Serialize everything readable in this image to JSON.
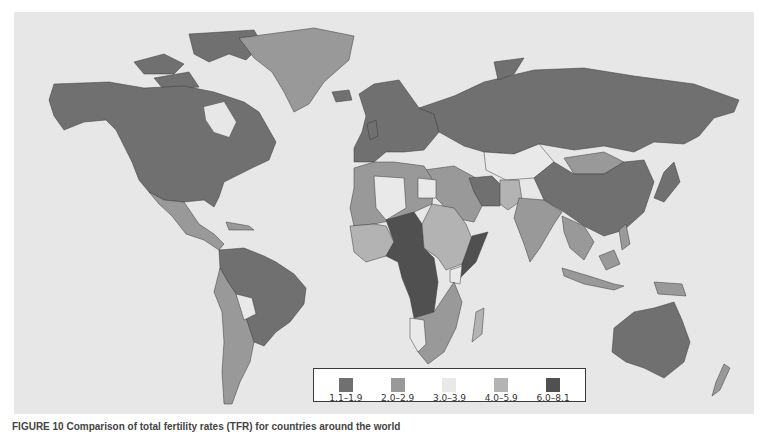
{
  "figure": {
    "caption": "FIGURE 10 Comparison of total fertility rates (TFR) for countries around the world"
  },
  "legend": {
    "items": [
      {
        "label": "1.1–1.9",
        "color": "#707070"
      },
      {
        "label": "2.0–2.9",
        "color": "#999999"
      },
      {
        "label": "3.0–3.9",
        "color": "#e9e9e9"
      },
      {
        "label": "4.0–5.9",
        "color": "#b3b3b3"
      },
      {
        "label": "6.0–8.1",
        "color": "#505050"
      }
    ]
  },
  "map": {
    "background": "#e7e7e7",
    "regions": [
      {
        "name": "North America (USA, Canada)",
        "class": "1.1–1.9"
      },
      {
        "name": "Greenland",
        "class": "2.0–2.9"
      },
      {
        "name": "Mexico / Central America",
        "class": "2.0–2.9"
      },
      {
        "name": "Brazil / Colombia / Venezuela",
        "class": "1.1–1.9"
      },
      {
        "name": "Argentina / Peru",
        "class": "2.0–2.9"
      },
      {
        "name": "Bolivia",
        "class": "3.0–3.9"
      },
      {
        "name": "Europe / Russia",
        "class": "1.1–1.9"
      },
      {
        "name": "China",
        "class": "1.1–1.9"
      },
      {
        "name": "Kazakhstan",
        "class": "3.0–3.9"
      },
      {
        "name": "Mongolia",
        "class": "2.0–2.9"
      },
      {
        "name": "India",
        "class": "2.0–2.9"
      },
      {
        "name": "Iran",
        "class": "1.1–1.9"
      },
      {
        "name": "Middle East",
        "class": "2.0–2.9"
      },
      {
        "name": "North Africa",
        "class": "2.0–2.9"
      },
      {
        "name": "Sahel / Central Africa (Niger, Chad, DRC, Angola, Somalia)",
        "class": "6.0–8.1"
      },
      {
        "name": "West / East Africa",
        "class": "4.0–5.9"
      },
      {
        "name": "Southern Africa",
        "class": "2.0–2.9"
      },
      {
        "name": "Namibia / Kenya",
        "class": "3.0–3.9"
      },
      {
        "name": "Southeast Asia / Indonesia",
        "class": "2.0–2.9"
      },
      {
        "name": "Japan",
        "class": "1.1–1.9"
      },
      {
        "name": "Australia / New Zealand",
        "class": "1.1–1.9"
      }
    ]
  }
}
